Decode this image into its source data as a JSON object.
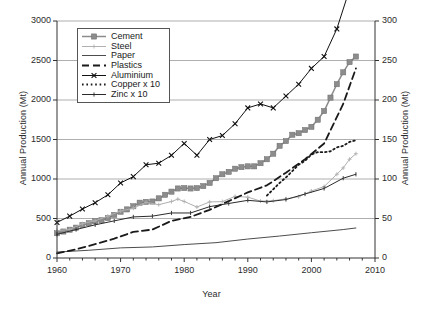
{
  "chart_data": {
    "type": "line",
    "title": "",
    "xlabel": "Year",
    "ylabel": "Annual Production (Mt)",
    "ylabel_right": "Annual Production (Mt)",
    "xlim": [
      1960,
      2010
    ],
    "ylim": [
      0,
      3000
    ],
    "ylim_right": [
      0,
      300
    ],
    "xticks": [
      1960,
      1970,
      1980,
      1990,
      2000,
      2010
    ],
    "xtick_labels": [
      "1960",
      "1970",
      "1980",
      "1990",
      "2000",
      "2010"
    ],
    "xminor_step": 2,
    "yticks": [
      0,
      500,
      1000,
      1500,
      2000,
      2500,
      3000
    ],
    "ytick_labels": [
      "0",
      "500",
      "1000",
      "1500",
      "2000",
      "2500",
      "3000"
    ],
    "yticks_right": [
      0,
      50,
      100,
      150,
      200,
      250,
      300
    ],
    "ytick_labels_right": [
      "0",
      "50",
      "100",
      "150",
      "200",
      "250",
      "300"
    ],
    "grid": "horizontal",
    "legend_position": "upper-left-inset",
    "right_axis_note": "Right axis equals left axis divided by 10",
    "series": [
      {
        "name": "Cement",
        "color": "#8c8c8c",
        "marker": "square",
        "linestyle": "solid",
        "axis": "left",
        "x": [
          1960,
          1961,
          1962,
          1963,
          1964,
          1965,
          1966,
          1967,
          1968,
          1969,
          1970,
          1971,
          1972,
          1973,
          1974,
          1975,
          1976,
          1977,
          1978,
          1979,
          1980,
          1981,
          1982,
          1983,
          1984,
          1985,
          1986,
          1987,
          1988,
          1989,
          1990,
          1991,
          1992,
          1993,
          1994,
          1995,
          1996,
          1997,
          1998,
          1999,
          2000,
          2001,
          2002,
          2003,
          2004,
          2005,
          2006,
          2007
        ],
        "values": [
          314,
          335,
          358,
          384,
          417,
          440,
          464,
          478,
          505,
          545,
          585,
          615,
          655,
          700,
          710,
          715,
          755,
          800,
          840,
          880,
          885,
          880,
          885,
          910,
          950,
          1010,
          1060,
          1090,
          1130,
          1150,
          1160,
          1160,
          1200,
          1250,
          1320,
          1420,
          1480,
          1560,
          1580,
          1620,
          1660,
          1750,
          1860,
          2030,
          2200,
          2350,
          2480,
          2550
        ]
      },
      {
        "name": "Steel",
        "color": "#b0b0b0",
        "marker": "small-cross",
        "linestyle": "solid",
        "axis": "left",
        "x": [
          1960,
          1962,
          1964,
          1966,
          1968,
          1970,
          1972,
          1974,
          1976,
          1978,
          1979,
          1980,
          1982,
          1984,
          1986,
          1988,
          1990,
          1992,
          1994,
          1996,
          1998,
          2000,
          2002,
          2004,
          2005,
          2006,
          2007
        ],
        "values": [
          347,
          360,
          435,
          470,
          530,
          595,
          630,
          705,
          675,
          715,
          745,
          716,
          645,
          710,
          714,
          780,
          770,
          720,
          725,
          750,
          775,
          848,
          904,
          1060,
          1140,
          1250,
          1320
        ]
      },
      {
        "name": "Paper",
        "color": "#4d4d4d",
        "marker": "none",
        "linestyle": "solid",
        "axis": "left",
        "x": [
          1960,
          1965,
          1970,
          1975,
          1980,
          1985,
          1990,
          1995,
          2000,
          2005,
          2007
        ],
        "values": [
          75,
          98,
          128,
          140,
          170,
          194,
          240,
          278,
          320,
          360,
          380
        ]
      },
      {
        "name": "Plastics",
        "color": "#1a1a1a",
        "marker": "none",
        "linestyle": "dashed",
        "axis": "left",
        "x": [
          1960,
          1963,
          1966,
          1969,
          1972,
          1975,
          1978,
          1981,
          1984,
          1987,
          1990,
          1993,
          1996,
          1999,
          2002,
          2005,
          2007
        ],
        "values": [
          60,
          110,
          175,
          245,
          330,
          360,
          470,
          520,
          610,
          720,
          830,
          920,
          1080,
          1250,
          1450,
          1950,
          2400
        ]
      },
      {
        "name": "Aluminium",
        "color": "#111111",
        "marker": "x",
        "linestyle": "solid",
        "axis": "right",
        "x": [
          1960,
          1962,
          1964,
          1966,
          1968,
          1970,
          1972,
          1974,
          1976,
          1978,
          1980,
          1982,
          1984,
          1986,
          1988,
          1990,
          1992,
          1994,
          1996,
          1998,
          2000,
          2002,
          2004,
          2006,
          2007
        ],
        "values": [
          45,
          53,
          62,
          70,
          80,
          95,
          103,
          118,
          120,
          130,
          145,
          130,
          150,
          155,
          170,
          190,
          195,
          190,
          205,
          220,
          240,
          255,
          290,
          340,
          380
        ]
      },
      {
        "name": "Copper x 10",
        "color": "#1a1a1a",
        "marker": "none",
        "linestyle": "dotted",
        "axis": "left",
        "x": [
          1993,
          1994,
          1995,
          1996,
          1997,
          1998,
          1999,
          2000,
          2001,
          2002,
          2003,
          2004,
          2005,
          2006,
          2007
        ],
        "values": [
          790,
          870,
          950,
          1020,
          1100,
          1180,
          1230,
          1310,
          1340,
          1340,
          1350,
          1400,
          1420,
          1470,
          1490
        ]
      },
      {
        "name": "Zinc x 10",
        "color": "#2b2b2b",
        "marker": "tick",
        "linestyle": "solid",
        "axis": "left",
        "x": [
          1960,
          1963,
          1966,
          1969,
          1972,
          1975,
          1978,
          1981,
          1984,
          1987,
          1990,
          1993,
          1996,
          1999,
          2002,
          2005,
          2007
        ],
        "values": [
          300,
          360,
          420,
          470,
          520,
          530,
          570,
          570,
          650,
          690,
          730,
          710,
          740,
          810,
          880,
          1010,
          1060
        ]
      }
    ]
  },
  "legend": {
    "items": [
      {
        "label": "Cement"
      },
      {
        "label": "Steel"
      },
      {
        "label": "Paper"
      },
      {
        "label": "Plastics"
      },
      {
        "label": "Aluminium"
      },
      {
        "label": "Copper x 10"
      },
      {
        "label": "Zinc x 10"
      }
    ]
  }
}
